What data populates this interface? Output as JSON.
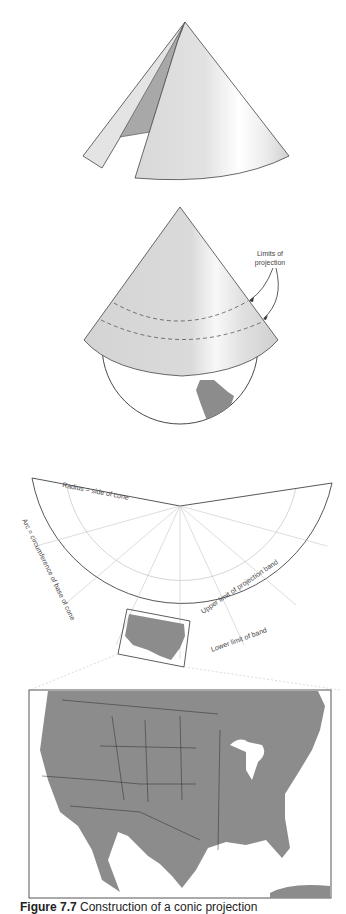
{
  "figure": {
    "panels": [
      {
        "name": "unrolling-cone",
        "description": "Paper cone partly unrolled along a seam"
      },
      {
        "name": "cone-on-globe",
        "labels": {
          "limits": [
            "Limits of",
            "projection"
          ]
        }
      },
      {
        "name": "flattened-cone",
        "labels": {
          "radius": "Radius = side of cone",
          "arc": "Arc = circumference of base of cone",
          "upper": "Upper limit of projection band",
          "lower": "Lower limit of band"
        }
      },
      {
        "name": "usa-map",
        "description": "Map of contiguous United States with state boundaries"
      }
    ],
    "caption": {
      "number": "Figure 7.7",
      "text": "Construction of a conic projection",
      "note": "Wording inferred from a truncated line at the bottom edge; not verified against the pixels."
    }
  },
  "colors": {
    "land": "#8c8c8c",
    "cone_light": "#e6e6e6",
    "cone_dark": "#a9a9a9",
    "outline": "#333333",
    "grid": "#b8b8b8"
  }
}
